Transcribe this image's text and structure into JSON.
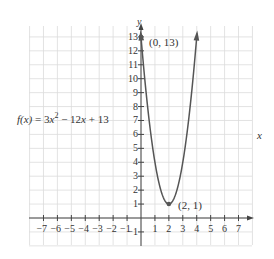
{
  "chart_data": {
    "type": "line",
    "title": "",
    "function_label": "f(x) = 3x^2 - 12x + 13",
    "function_parts": {
      "lhs": "f(x)",
      "eq": " = 3",
      "x1": "x",
      "exp": "2",
      "mid": " − 12",
      "x2": "x",
      "tail": " + 13"
    },
    "xlabel": "x",
    "ylabel": "y",
    "xlim": [
      -7,
      7
    ],
    "ylim": [
      -1,
      13
    ],
    "grid": true,
    "x_ticks": [
      -7,
      -6,
      -5,
      -4,
      -3,
      -2,
      -1,
      1,
      2,
      3,
      4,
      5,
      6,
      7
    ],
    "y_ticks": [
      -1,
      1,
      2,
      3,
      4,
      5,
      6,
      7,
      8,
      9,
      10,
      11,
      12,
      13
    ],
    "x_tick_labels": [
      "−7",
      "−6",
      "−5",
      "−4",
      "−3",
      "−2",
      "−1",
      "1",
      "2",
      "3",
      "4",
      "5",
      "6",
      "7"
    ],
    "y_tick_labels": [
      "−1",
      "1",
      "2",
      "3",
      "4",
      "5",
      "6",
      "7",
      "8",
      "9",
      "10",
      "11",
      "12",
      "13"
    ],
    "series": [
      {
        "name": "f(x) = 3x^2 - 12x + 13",
        "coefficients": {
          "a": 3,
          "b": -12,
          "c": 13
        },
        "x": [
          -0.05,
          0,
          0.5,
          1,
          1.5,
          2,
          2.5,
          3,
          3.5,
          4,
          4.05
        ],
        "y": [
          13.6,
          13,
          7.75,
          4,
          1.75,
          1,
          1.75,
          4,
          7.75,
          13,
          13.6
        ]
      }
    ],
    "annotations": [
      {
        "label": "(0, 13)",
        "x": 0,
        "y": 13,
        "type": "y-intercept"
      },
      {
        "label": "(2, 1)",
        "x": 2,
        "y": 1,
        "type": "vertex"
      }
    ],
    "colors": {
      "curve": "#555555",
      "axis": "#444444",
      "grid": "#dcdcdc",
      "text": "#333333"
    }
  }
}
